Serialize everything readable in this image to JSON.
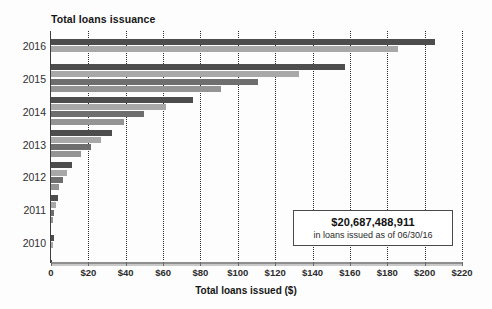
{
  "chart_data": {
    "type": "bar",
    "orientation": "horizontal",
    "title": "Total loans issuance",
    "xlabel": "Total loans issued ($)",
    "ylabel": "",
    "xlim": [
      0,
      220
    ],
    "xtick_labels": [
      "0",
      "$20",
      "$40",
      "$60",
      "$80",
      "$100",
      "$120",
      "$140",
      "$160",
      "$180",
      "$200",
      "$220"
    ],
    "xticks": [
      0,
      20,
      40,
      60,
      80,
      100,
      120,
      140,
      160,
      180,
      200,
      220
    ],
    "categories": [
      "2016",
      "2015",
      "2014",
      "2013",
      "2012",
      "2011",
      "2010"
    ],
    "grid": true,
    "grid_style": "dotted-vertical",
    "legend": "none",
    "note": "Cumulative loans issued, billions of dollars; bars within each year are successive quarters",
    "groups": [
      {
        "year": "2016",
        "values": [
          205.5,
          186.0
        ]
      },
      {
        "year": "2015",
        "values": [
          157.5,
          133.0,
          111.0,
          91.0
        ]
      },
      {
        "year": "2014",
        "values": [
          76.0,
          61.5,
          50.0,
          39.0
        ]
      },
      {
        "year": "2013",
        "values": [
          32.5,
          27.0,
          21.5,
          16.0
        ]
      },
      {
        "year": "2012",
        "values": [
          11.5,
          8.5,
          6.5,
          4.5
        ]
      },
      {
        "year": "2011",
        "values": [
          3.8,
          2.6,
          1.8,
          1.2
        ]
      },
      {
        "year": "2010",
        "values": [
          1.4,
          0.6
        ]
      }
    ],
    "bar_colors": [
      "#4d4d4d",
      "#a8a8a8",
      "#6e6e6e",
      "#949494"
    ],
    "annotation": {
      "amount": "$20,687,488,911",
      "caption": "in loans issued as of 06/30/16"
    }
  }
}
